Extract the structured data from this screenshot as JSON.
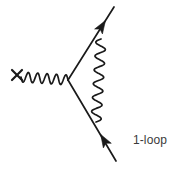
{
  "figure": {
    "kind": "feynman-diagram",
    "background_color": "#ffffff",
    "ink_color": "#1a1a1a",
    "caption": "1-loop",
    "caption_color": "#3a3a3a"
  },
  "elements": {
    "external_field_cross": {
      "label": "x",
      "center_x": 17,
      "center_y": 75,
      "arm": 5
    },
    "external_photon": {
      "name": "external-photon-wavy-line",
      "from_x": 21,
      "from_y": 77,
      "to_x": 68,
      "to_y": 80,
      "periods": 5,
      "amplitude": 5
    },
    "vertex": {
      "name": "interaction-vertex",
      "x": 68,
      "y": 80
    },
    "outgoing_fermion": {
      "name": "outgoing-fermion-line",
      "from_x": 68,
      "from_y": 80,
      "to_x": 114,
      "to_y": 7,
      "arrow_x": 102,
      "arrow_y": 26,
      "direction": "outgoing"
    },
    "incoming_fermion": {
      "name": "incoming-fermion-line",
      "from_x": 68,
      "from_y": 80,
      "to_x": 116,
      "to_y": 161,
      "arrow_x": 104,
      "arrow_y": 140,
      "direction": "incoming"
    },
    "loop_photon": {
      "name": "loop-photon-wavy-line",
      "from_x": 101,
      "from_y": 39,
      "to_x": 96,
      "to_y": 122,
      "periods": 6,
      "amplitude": 5
    }
  }
}
